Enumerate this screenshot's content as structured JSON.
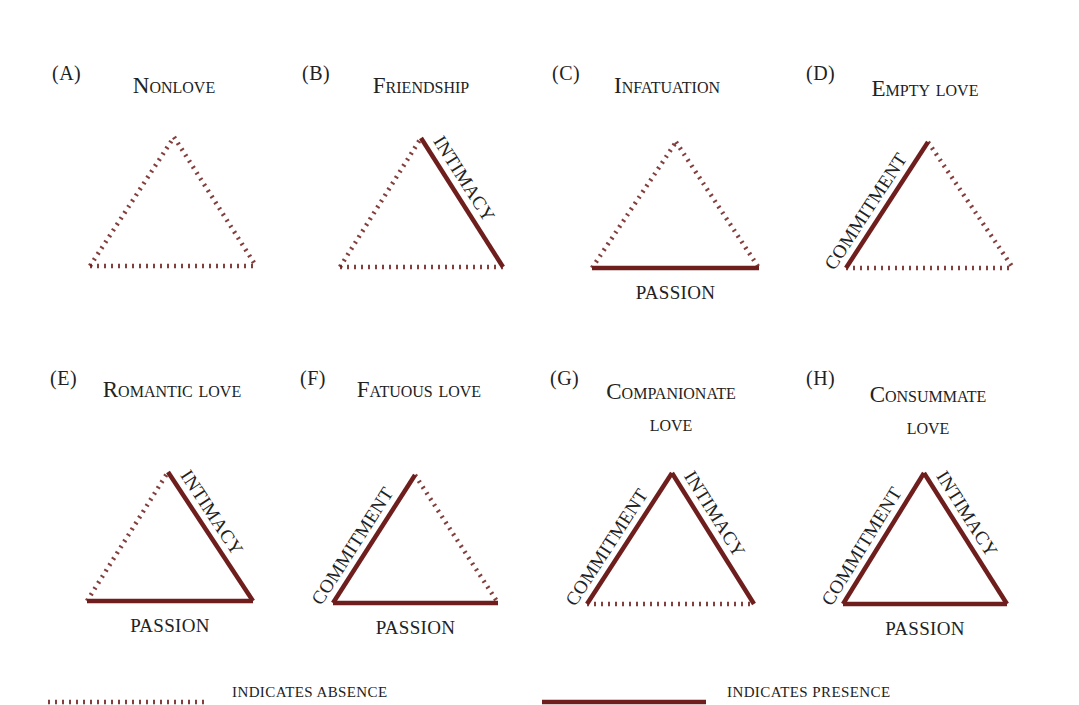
{
  "colors": {
    "line": "#6e1e1c",
    "text": "#222222",
    "background": "#ffffff"
  },
  "edge_names": {
    "left": "COMMITMENT",
    "right": "INTIMACY",
    "bottom": "PASSION"
  },
  "panels": [
    {
      "letter": "(A)",
      "title": "Nonlove",
      "title_line2": "",
      "letter_pos": [
        52,
        70
      ],
      "title_center": [
        174,
        86
      ],
      "apex": [
        174,
        137
      ],
      "bl": [
        90,
        266
      ],
      "br": [
        256,
        266
      ],
      "commitment": false,
      "intimacy": false,
      "passion": false,
      "labels": {
        "left": "",
        "right": "",
        "bottom": ""
      }
    },
    {
      "letter": "(B)",
      "title": "Friendship",
      "title_line2": "",
      "letter_pos": [
        302,
        70
      ],
      "title_center": [
        421,
        86
      ],
      "apex": [
        421,
        138
      ],
      "bl": [
        340,
        267
      ],
      "br": [
        503,
        267
      ],
      "commitment": false,
      "intimacy": true,
      "passion": false,
      "labels": {
        "left": "",
        "right": "INTIMACY",
        "bottom": ""
      }
    },
    {
      "letter": "(C)",
      "title": "Infatuation",
      "title_line2": "",
      "letter_pos": [
        552,
        70
      ],
      "title_center": [
        667,
        86
      ],
      "apex": [
        676,
        142
      ],
      "bl": [
        592,
        268
      ],
      "br": [
        759,
        268
      ],
      "commitment": false,
      "intimacy": false,
      "passion": true,
      "labels": {
        "left": "",
        "right": "",
        "bottom": "PASSION"
      }
    },
    {
      "letter": "(D)",
      "title": "Empty love",
      "title_line2": "",
      "letter_pos": [
        806,
        70
      ],
      "title_center": [
        925,
        89
      ],
      "apex": [
        928,
        142
      ],
      "bl": [
        846,
        268
      ],
      "br": [
        1013,
        268
      ],
      "commitment": true,
      "intimacy": false,
      "passion": false,
      "labels": {
        "left": "COMMITMENT",
        "right": "",
        "bottom": ""
      }
    },
    {
      "letter": "(E)",
      "title": "Romantic love",
      "title_line2": "",
      "letter_pos": [
        50,
        375
      ],
      "title_center": [
        172,
        390
      ],
      "apex": [
        168,
        472
      ],
      "bl": [
        87,
        601
      ],
      "br": [
        253,
        601
      ],
      "commitment": false,
      "intimacy": true,
      "passion": true,
      "labels": {
        "left": "",
        "right": "INTIMACY",
        "bottom": "PASSION"
      }
    },
    {
      "letter": "(F)",
      "title": "Fatuous love",
      "title_line2": "",
      "letter_pos": [
        300,
        375
      ],
      "title_center": [
        419,
        390
      ],
      "apex": [
        415,
        475
      ],
      "bl": [
        333,
        603
      ],
      "br": [
        498,
        603
      ],
      "commitment": true,
      "intimacy": false,
      "passion": true,
      "labels": {
        "left": "COMMITMENT",
        "right": "",
        "bottom": "PASSION"
      }
    },
    {
      "letter": "(G)",
      "title": "Companionate",
      "title_line2": "love",
      "letter_pos": [
        550,
        375
      ],
      "title_center": [
        671,
        392
      ],
      "apex": [
        672,
        473
      ],
      "bl": [
        587,
        604
      ],
      "br": [
        754,
        604
      ],
      "commitment": true,
      "intimacy": true,
      "passion": false,
      "labels": {
        "left": "COMMITMENT",
        "right": "INTIMACY",
        "bottom": ""
      }
    },
    {
      "letter": "(H)",
      "title": "Consummate",
      "title_line2": "love",
      "letter_pos": [
        806,
        375
      ],
      "title_center": [
        928,
        395
      ],
      "apex": [
        924,
        473
      ],
      "bl": [
        843,
        604
      ],
      "br": [
        1007,
        604
      ],
      "commitment": true,
      "intimacy": true,
      "passion": true,
      "labels": {
        "left": "COMMITMENT",
        "right": "INTIMACY",
        "bottom": "PASSION"
      }
    }
  ],
  "legend": {
    "absence_text": "INDICATES ABSENCE",
    "presence_text": "INDICATES PRESENCE",
    "absence_line": [
      48,
      704,
      204,
      704
    ],
    "presence_line": [
      542,
      704,
      706,
      704
    ],
    "absence_text_pos": [
      232,
      688
    ],
    "presence_text_pos": [
      727,
      688
    ]
  }
}
